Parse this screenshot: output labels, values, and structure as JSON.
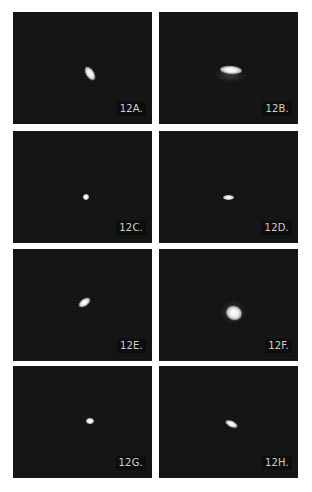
{
  "figure": {
    "background_color": "#ffffff",
    "panel_background_color": "#141414",
    "label_text_color": "#cfcfcf",
    "panels": [
      {
        "id": "A",
        "label": "12A."
      },
      {
        "id": "B",
        "label": "12B."
      },
      {
        "id": "C",
        "label": "12C."
      },
      {
        "id": "D",
        "label": "12D."
      },
      {
        "id": "E",
        "label": "12E."
      },
      {
        "id": "F",
        "label": "12F."
      },
      {
        "id": "G",
        "label": "12G."
      },
      {
        "id": "H",
        "label": "12H."
      }
    ]
  }
}
